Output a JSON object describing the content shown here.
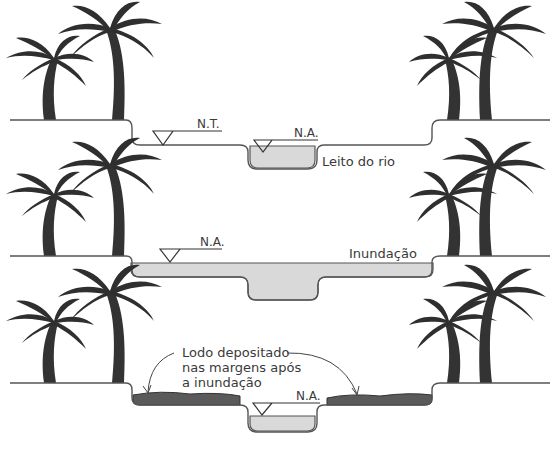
{
  "colors": {
    "water": "#d9d9d9",
    "mud": "#5a5a5a",
    "ink": "#333333"
  },
  "panels": [
    {
      "name": "normal",
      "labels": {
        "nt": "N.T.",
        "na": "N.A.",
        "river_bed": "Leito do rio"
      }
    },
    {
      "name": "flood",
      "labels": {
        "na": "N.A.",
        "flood": "Inundação"
      }
    },
    {
      "name": "after-flood",
      "labels": {
        "na": "N.A.",
        "silt_line1": "Lodo depositado",
        "silt_line2": "nas margens após",
        "silt_line3": "a inundação"
      }
    }
  ]
}
